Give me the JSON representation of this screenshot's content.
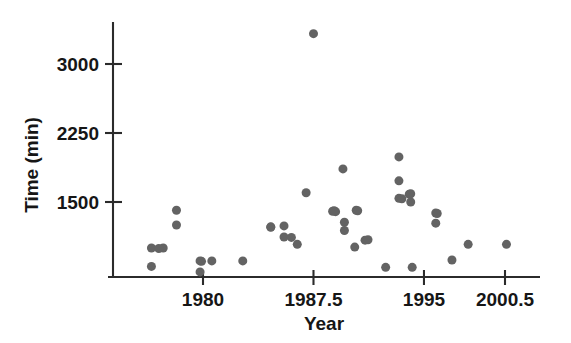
{
  "chart_data": {
    "type": "scatter",
    "title": "",
    "xlabel": "Year",
    "ylabel": "Time (min)",
    "xlim": [
      1975.8,
      2002.3
    ],
    "ylim": [
      0,
      3450
    ],
    "grid": false,
    "legend": null,
    "marker": {
      "shape": "circle",
      "color": "#636363",
      "size_px": 9
    },
    "xticks": [
      1980,
      1987.5,
      1995,
      2000.5
    ],
    "xtick_labels": [
      "1980",
      "1987.5",
      "1995",
      "2000.5"
    ],
    "yticks": [
      1500,
      2250,
      3000
    ],
    "ytick_labels": [
      "1500",
      "2250",
      "3000"
    ],
    "n_points": 45,
    "points": [
      {
        "x": 1976.5,
        "y": 1000
      },
      {
        "x": 1976.5,
        "y": 800
      },
      {
        "x": 1977.3,
        "y": 1000
      },
      {
        "x": 1978.2,
        "y": 1410
      },
      {
        "x": 1978.2,
        "y": 1250
      },
      {
        "x": 1979.8,
        "y": 860
      },
      {
        "x": 1979.8,
        "y": 740
      },
      {
        "x": 1980.6,
        "y": 860
      },
      {
        "x": 1982.7,
        "y": 860
      },
      {
        "x": 1984.6,
        "y": 1230
      },
      {
        "x": 1985.5,
        "y": 1240
      },
      {
        "x": 1985.5,
        "y": 1120
      },
      {
        "x": 1986.4,
        "y": 1040
      },
      {
        "x": 1987.0,
        "y": 1600
      },
      {
        "x": 1987.5,
        "y": 3330
      },
      {
        "x": 1988.8,
        "y": 1400
      },
      {
        "x": 1989.5,
        "y": 1860
      },
      {
        "x": 1989.6,
        "y": 1280
      },
      {
        "x": 1989.6,
        "y": 1190
      },
      {
        "x": 1990.4,
        "y": 1410
      },
      {
        "x": 1990.3,
        "y": 1010
      },
      {
        "x": 1991.2,
        "y": 1090
      },
      {
        "x": 1992.4,
        "y": 790
      },
      {
        "x": 1993.3,
        "y": 1990
      },
      {
        "x": 1993.3,
        "y": 1730
      },
      {
        "x": 1993.3,
        "y": 1540
      },
      {
        "x": 1994.1,
        "y": 1590
      },
      {
        "x": 1994.1,
        "y": 1500
      },
      {
        "x": 1994.2,
        "y": 790
      },
      {
        "x": 1995.8,
        "y": 1380
      },
      {
        "x": 1995.8,
        "y": 1270
      },
      {
        "x": 1996.9,
        "y": 870
      },
      {
        "x": 1998.0,
        "y": 1040
      },
      {
        "x": 2000.6,
        "y": 1040
      },
      {
        "x": 1977.0,
        "y": 995
      },
      {
        "x": 1984.6,
        "y": 1225
      },
      {
        "x": 1986.0,
        "y": 1115
      },
      {
        "x": 1989.0,
        "y": 1395
      },
      {
        "x": 1991.0,
        "y": 1085
      },
      {
        "x": 1993.5,
        "y": 1535
      },
      {
        "x": 1994.0,
        "y": 1585
      },
      {
        "x": 1995.9,
        "y": 1375
      },
      {
        "x": 1979.9,
        "y": 855
      },
      {
        "x": 1988.9,
        "y": 1405
      },
      {
        "x": 1990.5,
        "y": 1405
      }
    ]
  },
  "axes": {
    "y_axis_title": "Time (min)",
    "x_axis_title": "Year"
  }
}
